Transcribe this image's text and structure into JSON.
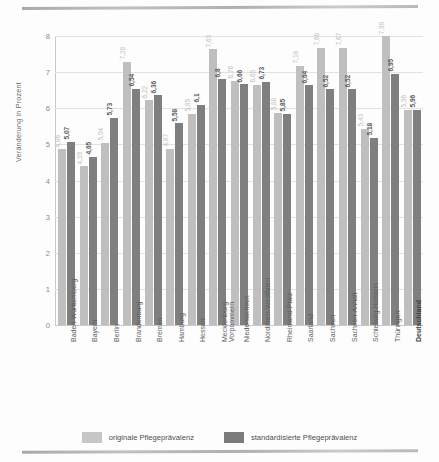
{
  "chart_data": {
    "type": "bar",
    "title": "",
    "xlabel": "",
    "ylabel": "Veränderung in Prozent",
    "ylim": [
      0,
      8
    ],
    "yticks": [
      "0",
      "1",
      "2",
      "3",
      "4",
      "5",
      "6",
      "7",
      "8"
    ],
    "grid": true,
    "legend_position": "bottom",
    "categories": [
      "Baden-Württemberg",
      "Bayern",
      "Berlin",
      "Brandenburg",
      "Bremen",
      "Hamburg",
      "Hessen",
      "Mecklenburg-Vorpommern",
      "Niedersachsen",
      "Nordrhein-Westfalen",
      "Rheinland-Pfalz",
      "Saarland",
      "Sachsen",
      "Sachsen-Anhalt",
      "Schleswig-Holstein",
      "Thüringen",
      "Deutschland"
    ],
    "series": [
      {
        "name": "originale Pflegeprävalenz",
        "color": "#bfbfbf",
        "values": [
          4.86,
          4.39,
          5.04,
          7.28,
          6.22,
          4.87,
          5.85,
          7.63,
          6.76,
          6.65,
          5.88,
          7.18,
          7.68,
          7.67,
          5.43,
          7.99,
          5.96
        ],
        "labels": [
          "4,86",
          "4,39",
          "5,04",
          "7,28",
          "6,22",
          "4,87",
          "5,85",
          "7,63",
          "6,76",
          "6,65",
          "5,88",
          "7,18",
          "7,68",
          "7,67",
          "5,43",
          "7,99",
          "5,96"
        ]
      },
      {
        "name": "standardisierte Pflegeprävalenz",
        "color": "#7f7f7f",
        "values": [
          5.07,
          4.65,
          5.73,
          6.54,
          6.36,
          5.58,
          6.1,
          6.8,
          6.66,
          6.73,
          5.85,
          6.64,
          6.52,
          6.52,
          5.18,
          6.95,
          5.96
        ],
        "labels": [
          "5,07",
          "4,65",
          "5,73",
          "6,54",
          "6,36",
          "5,58",
          "6,1",
          "6,8",
          "6,66",
          "6,73",
          "5,85",
          "6,64",
          "6,52",
          "6,52",
          "5,18",
          "6,95",
          "5,96"
        ]
      }
    ]
  },
  "legend": {
    "items": [
      {
        "label": "originale Pflegeprävalenz",
        "color": "#bfbfbf"
      },
      {
        "label": "standardisierte Pflegeprävalenz",
        "color": "#7f7f7f"
      }
    ]
  }
}
